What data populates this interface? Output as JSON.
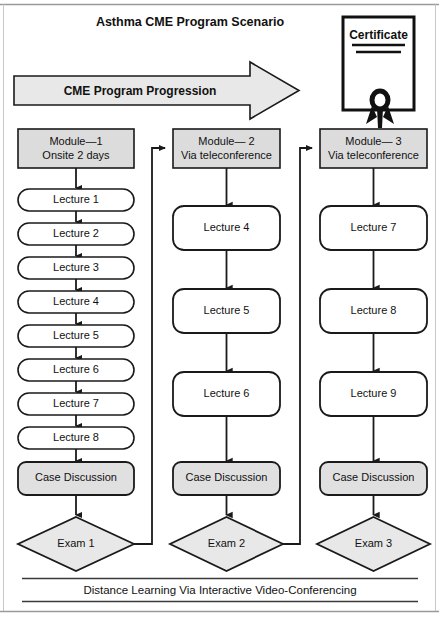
{
  "page": {
    "title": "Asthma CME Program Scenario",
    "footer": "Distance Learning Via Interactive Video-Conferencing",
    "background": "#ffffff"
  },
  "banner": {
    "label": "CME Program Progression",
    "fill": "#e8e8e8",
    "stroke": "#1a1a1a"
  },
  "certificate": {
    "label": "Certificate",
    "fill": "#ffffff",
    "stroke": "#111111",
    "ribbon_color": "#111111",
    "rule_count": 2
  },
  "colors": {
    "module_fill": "#dcdcdc",
    "lecture_fill": "#ffffff",
    "case_fill": "#e0e0e0",
    "exam_fill": "#e8e8e8",
    "stroke": "#1a1a1a",
    "frame": "#b0b0b0"
  },
  "columns": [
    {
      "id": "module-1",
      "module": {
        "line1": "Module—1",
        "line2": "Onsite 2 days"
      },
      "lectures": [
        "Lecture 1",
        "Lecture 2",
        "Lecture 3",
        "Lecture 4",
        "Lecture 5",
        "Lecture 6",
        "Lecture 7",
        "Lecture 8"
      ],
      "case_discussion": "Case Discussion",
      "exam": "Exam 1",
      "shape": "pill"
    },
    {
      "id": "module-2",
      "module": {
        "line1": "Module— 2",
        "line2": "Via teleconference"
      },
      "lectures": [
        "Lecture 4",
        "Lecture 5",
        "Lecture 6"
      ],
      "case_discussion": "Case Discussion",
      "exam": "Exam 2",
      "shape": "rounded"
    },
    {
      "id": "module-3",
      "module": {
        "line1": "Module— 3",
        "line2": "Via teleconference"
      },
      "lectures": [
        "Lecture 7",
        "Lecture 8",
        "Lecture 9"
      ],
      "case_discussion": "Case Discussion",
      "exam": "Exam 3",
      "shape": "rounded"
    }
  ],
  "feedback_links": [
    {
      "from": "Exam 1",
      "to": "Module— 2"
    },
    {
      "from": "Exam 2",
      "to": "Module— 3"
    }
  ]
}
